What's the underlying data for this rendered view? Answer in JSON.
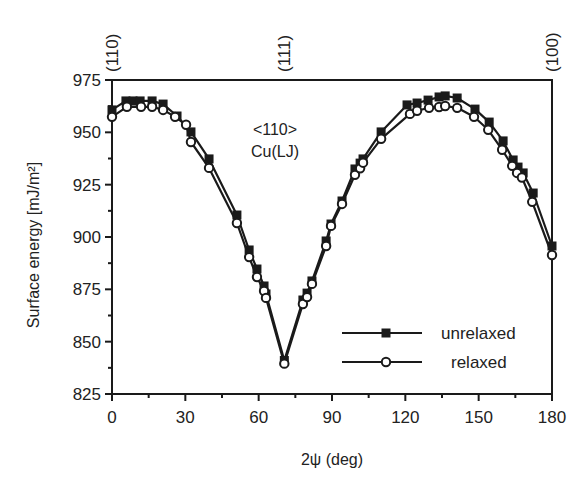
{
  "chart_data": {
    "type": "line",
    "title": "",
    "xlabel": "2ψ (deg)",
    "ylabel": "Surface energy [mJ/m²]",
    "xlim": [
      0,
      180
    ],
    "ylim": [
      825,
      975
    ],
    "xticks": [
      0,
      30,
      60,
      90,
      120,
      150,
      180
    ],
    "yticks": [
      825,
      850,
      875,
      900,
      925,
      950,
      975
    ],
    "grid": false,
    "legend_position": "lower right",
    "top_labels": [
      {
        "x": 0,
        "label": "(110)"
      },
      {
        "x": 70.5,
        "label": "(111)"
      },
      {
        "x": 180,
        "label": "(100)"
      }
    ],
    "annotations": [
      {
        "text": "<110>",
        "x": 60,
        "y": 952
      },
      {
        "text": "Cu(LJ)",
        "x": 60,
        "y": 943
      }
    ],
    "series": [
      {
        "name": "unrelaxed",
        "marker": "filled-square",
        "x": [
          0,
          5.7,
          8.6,
          11.5,
          16.4,
          20.9,
          26.6,
          32.3,
          39.7,
          51.1,
          56.1,
          59.3,
          62.2,
          63.0,
          70.5,
          78.1,
          79.8,
          81.8,
          87.6,
          89.6,
          94.1,
          99.4,
          101.5,
          102.7,
          110.1,
          120.7,
          124.8,
          129.3,
          133.8,
          136.3,
          141.2,
          148.5,
          154.3,
          160.0,
          164.1,
          166.1,
          168.2,
          172.3,
          180.0
        ],
        "values": [
          960.7,
          965.0,
          965.0,
          965.0,
          965.0,
          963.5,
          957.8,
          950.2,
          937.3,
          910.5,
          893.8,
          884.7,
          876.6,
          872.8,
          841.0,
          869.9,
          873.2,
          879.0,
          898.1,
          906.2,
          917.2,
          932.5,
          935.3,
          937.3,
          950.2,
          963.1,
          964.0,
          965.4,
          966.9,
          967.4,
          966.4,
          961.1,
          954.9,
          945.9,
          936.8,
          933.4,
          930.6,
          921.0,
          895.7
        ]
      },
      {
        "name": "relaxed",
        "marker": "open-circle",
        "x": [
          0,
          6.1,
          11.9,
          16.4,
          20.9,
          25.8,
          30.3,
          32.3,
          39.7,
          51.1,
          56.1,
          59.3,
          62.2,
          63.0,
          70.5,
          78.1,
          79.8,
          81.8,
          87.6,
          89.6,
          94.1,
          99.4,
          101.5,
          102.7,
          110.1,
          121.9,
          124.8,
          129.7,
          133.8,
          136.3,
          141.2,
          148.1,
          153.9,
          159.6,
          163.7,
          165.7,
          167.7,
          171.9,
          180.0
        ],
        "values": [
          957.4,
          962.2,
          962.2,
          962.2,
          960.7,
          957.4,
          953.6,
          945.4,
          933.0,
          906.7,
          890.4,
          880.9,
          874.2,
          870.9,
          839.5,
          868.0,
          871.3,
          877.6,
          895.7,
          905.3,
          915.8,
          929.7,
          932.8,
          935.5,
          946.9,
          958.8,
          960.3,
          961.7,
          962.1,
          962.6,
          961.7,
          957.4,
          951.2,
          941.7,
          934.0,
          930.6,
          928.4,
          916.8,
          891.4
        ]
      }
    ]
  },
  "legend": {
    "items": [
      {
        "label": "unrelaxed",
        "marker": "filled-square"
      },
      {
        "label": "relaxed",
        "marker": "open-circle"
      }
    ]
  },
  "colors": {
    "line": "#1a1a1a",
    "text": "#222222",
    "background": "#ffffff"
  }
}
